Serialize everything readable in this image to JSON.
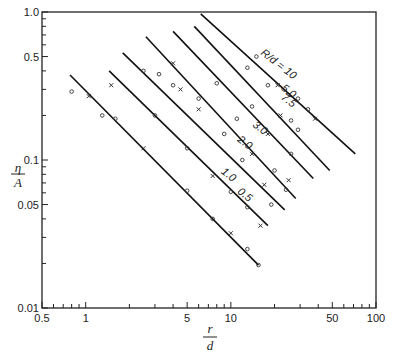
{
  "chart_data": {
    "type": "line",
    "title": "",
    "xlabel": "r/d",
    "ylabel": "η/A",
    "xscale": "log",
    "yscale": "log",
    "xlim": [
      0.5,
      100
    ],
    "ylim": [
      0.01,
      1.0
    ],
    "grid": false,
    "x_tick_labels": [
      "0.5",
      "1",
      "5",
      "10",
      "50",
      "100"
    ],
    "x_ticks": [
      0.5,
      1,
      5,
      10,
      50,
      100
    ],
    "y_tick_labels": [
      "0.01",
      "0.05",
      "0.1",
      "0.5",
      "1.0"
    ],
    "y_ticks": [
      0.01,
      0.05,
      0.1,
      0.5,
      1.0
    ],
    "legend_header": "R/d =",
    "series": [
      {
        "name": "0.5",
        "label": "0.5",
        "line": [
          [
            0.78,
            0.375
          ],
          [
            15.5,
            0.0195
          ]
        ],
        "points": [
          [
            0.8,
            0.29
          ],
          [
            1.05,
            0.27
          ],
          [
            1.3,
            0.2
          ],
          [
            1.6,
            0.19
          ],
          [
            2.5,
            0.12
          ],
          [
            5,
            0.062
          ],
          [
            7.5,
            0.04
          ],
          [
            10,
            0.032
          ],
          [
            13,
            0.025
          ],
          [
            15.5,
            0.0195
          ]
        ],
        "label_at": [
          11,
          0.06
        ]
      },
      {
        "name": "1.0",
        "label": "1.0",
        "line": [
          [
            1.45,
            0.4
          ],
          [
            18,
            0.036
          ]
        ],
        "points": [
          [
            1.5,
            0.32
          ],
          [
            3,
            0.2
          ],
          [
            5,
            0.12
          ],
          [
            7.5,
            0.078
          ],
          [
            10,
            0.061
          ],
          [
            13,
            0.048
          ],
          [
            16,
            0.036
          ]
        ],
        "label_at": [
          8.5,
          0.082
        ]
      },
      {
        "name": "2.0",
        "label": "2.0",
        "line": [
          [
            1.8,
            0.53
          ],
          [
            23.5,
            0.046
          ]
        ],
        "points": [
          [
            2.5,
            0.4
          ],
          [
            4,
            0.32
          ],
          [
            6,
            0.22
          ],
          [
            9,
            0.15
          ],
          [
            12,
            0.1
          ],
          [
            17,
            0.068
          ],
          [
            19,
            0.05
          ]
        ],
        "label_at": [
          11,
          0.135
        ]
      },
      {
        "name": "3.0",
        "label": "3.0",
        "line": [
          [
            2.6,
            0.68
          ],
          [
            28,
            0.055
          ]
        ],
        "points": [
          [
            3.2,
            0.38
          ],
          [
            4.5,
            0.3
          ],
          [
            6,
            0.26
          ],
          [
            11,
            0.19
          ],
          [
            14,
            0.11
          ],
          [
            20,
            0.085
          ],
          [
            24,
            0.063
          ],
          [
            25,
            0.073
          ]
        ],
        "label_at": [
          14,
          0.17
        ]
      },
      {
        "name": "5.0",
        "label": "5.0",
        "line": [
          [
            4.0,
            0.74
          ],
          [
            37,
            0.075
          ]
        ],
        "points": [
          [
            4,
            0.45
          ],
          [
            8,
            0.33
          ],
          [
            14,
            0.23
          ],
          [
            18,
            0.15
          ],
          [
            26,
            0.11
          ]
        ],
        "label_at": [
          22,
          0.3
        ]
      },
      {
        "name": "7.5",
        "label": "7.5",
        "line": [
          [
            5.6,
            0.8
          ],
          [
            48,
            0.085
          ]
        ],
        "points": [
          [
            13,
            0.42
          ],
          [
            18,
            0.32
          ],
          [
            22,
            0.2
          ],
          [
            26,
            0.185
          ],
          [
            29,
            0.16
          ]
        ],
        "label_at": [
          22,
          0.26
        ]
      },
      {
        "name": "10",
        "label": "10",
        "line": [
          [
            6.2,
            0.97
          ],
          [
            72,
            0.11
          ]
        ],
        "points": [
          [
            15,
            0.5
          ],
          [
            21,
            0.32
          ],
          [
            29,
            0.26
          ],
          [
            34,
            0.22
          ],
          [
            38,
            0.19
          ]
        ],
        "label_at": [
          30,
          0.52
        ]
      }
    ]
  }
}
